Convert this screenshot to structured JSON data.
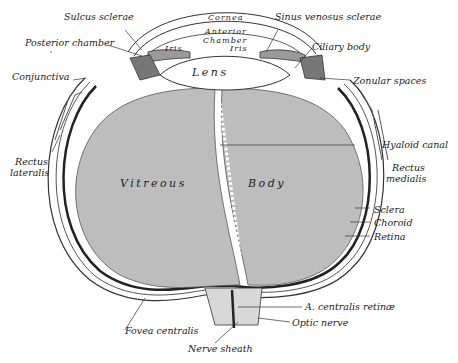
{
  "diagram": {
    "colors": {
      "vitreous": "#bdbdbd",
      "outline": "#333333",
      "background": "#ffffff",
      "lens": "#ffffff"
    },
    "inner_labels": {
      "cornea": "Cornea",
      "anterior_chamber": "Anterior\nChamber",
      "anterior": "Anterior",
      "chamber": "Chamber",
      "iris_left": "Iris",
      "iris_right": "Iris",
      "lens": "Lens",
      "vitreous": "Vitreous",
      "body": "Body"
    },
    "left_labels": {
      "sulcus_sclerae": "Sulcus sclerae",
      "posterior_chamber": "Posterior chamber",
      "conjunctiva": "Conjunctiva",
      "rectus_lateralis_1": "Rectus",
      "rectus_lateralis_2": "lateralis",
      "fovea_centralis": "Fovea centralis",
      "nerve_sheath": "Nerve sheath"
    },
    "right_labels": {
      "sinus_venosus_sclerae": "Sinus venosus sclerae",
      "ciliary_body": "Ciliary body",
      "zonular_spaces": "Zonular spaces",
      "hyaloid_canal": "Hyaloid canal",
      "rectus_medialis_1": "Rectus",
      "rectus_medialis_2": "medialis",
      "sclera": "Sclera",
      "choroid": "Choroid",
      "retina": "Retina",
      "a_centralis_retinae": "A. centralis retinæ",
      "optic_nerve": "Optic nerve"
    }
  }
}
